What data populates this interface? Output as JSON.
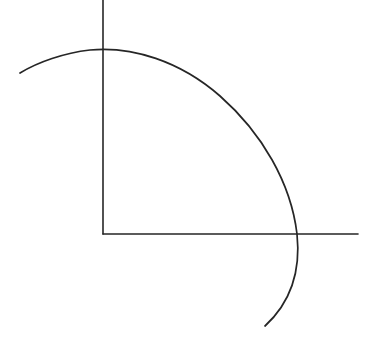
{
  "document": {
    "title": "Hand-drawn quarter circle with perpendicular axes",
    "background_color": "#ffffff",
    "width": 365,
    "height": 343
  },
  "style": {
    "ink_color": "#262626",
    "stroke_width": 1.6,
    "arc_stroke_width": 1.7
  },
  "chart_data": {
    "type": "diagram",
    "title": "",
    "subtitle": "",
    "xlabel": "",
    "ylabel": "",
    "grid": false,
    "legend": false,
    "annotations": [],
    "geometry": {
      "origin": {
        "x": 103,
        "y": 234
      },
      "circle": {
        "center_x": 103,
        "center_y": 234,
        "radius": 185
      },
      "elements": [
        {
          "name": "vertical-axis",
          "kind": "line",
          "x1": 103,
          "y1": 0,
          "x2": 103,
          "y2": 234
        },
        {
          "name": "horizontal-axis",
          "kind": "line",
          "x1": 103,
          "y1": 234,
          "x2": 358,
          "y2": 234
        },
        {
          "name": "quarter-circle-arc",
          "kind": "arc",
          "path": "M 20 73 C 38 62 64 53 90 50 C 132 46 180 61 220 96 C 262 133 291 183 297 234 C 301 272 290 303 265 326",
          "start_point": {
            "x": 20,
            "y": 73
          },
          "apex_point": {
            "x": 103,
            "y": 50
          },
          "axis_crossing_point": {
            "x": 297,
            "y": 234
          },
          "end_point": {
            "x": 265,
            "y": 326
          }
        }
      ]
    }
  }
}
